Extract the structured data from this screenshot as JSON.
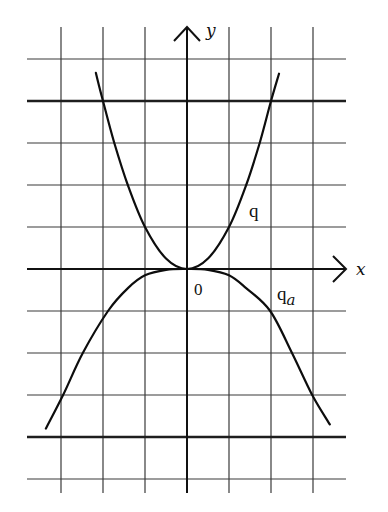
{
  "figure": {
    "origin_px": [
      187,
      269
    ],
    "unit_px": 42,
    "grid": {
      "x_lines_units": [
        -3,
        -2,
        -1,
        0,
        1,
        2,
        3
      ],
      "y_lines_units": [
        5,
        4,
        3,
        2,
        1,
        0,
        -1,
        -2,
        -3,
        -4,
        -5
      ],
      "thick_y_units": [
        4,
        -4
      ],
      "x_extent_px": [
        27,
        346
      ],
      "y_extent_px": [
        27,
        493
      ]
    },
    "axes": {
      "x_label": "x",
      "y_label": "y",
      "origin_label": "0"
    },
    "curves": [
      {
        "name": "q",
        "label": "q",
        "label_sub": "",
        "equation": "y = x^2",
        "points_units": [
          [
            -2.17,
            4.67
          ],
          [
            -2,
            4
          ],
          [
            -1.73,
            3
          ],
          [
            -1.41,
            2
          ],
          [
            -1,
            1
          ],
          [
            -0.5,
            0.25
          ],
          [
            0,
            0
          ],
          [
            0.5,
            0.25
          ],
          [
            1,
            1
          ],
          [
            1.41,
            2
          ],
          [
            1.73,
            3
          ],
          [
            2,
            4
          ],
          [
            2.19,
            4.65
          ]
        ],
        "label_pos_px": [
          249,
          217
        ]
      },
      {
        "name": "q_a",
        "label": "q",
        "label_sub": "a",
        "equation": "downward curve through (0,0), (±2,−1), (±2.5,−2), (±3,−3)",
        "points_units": [
          [
            -3.36,
            -3.8
          ],
          [
            -2.95,
            -3
          ],
          [
            -2.48,
            -2
          ],
          [
            -1.88,
            -1
          ],
          [
            -1.4,
            -0.45
          ],
          [
            -1,
            -0.15
          ],
          [
            -0.5,
            -0.02
          ],
          [
            0,
            0
          ],
          [
            0.5,
            -0.02
          ],
          [
            1,
            -0.15
          ],
          [
            1.4,
            -0.45
          ],
          [
            1.98,
            -1
          ],
          [
            2.5,
            -2
          ],
          [
            2.98,
            -3
          ],
          [
            3.4,
            -3.7
          ]
        ],
        "label_pos_px": [
          277,
          300
        ]
      }
    ]
  }
}
